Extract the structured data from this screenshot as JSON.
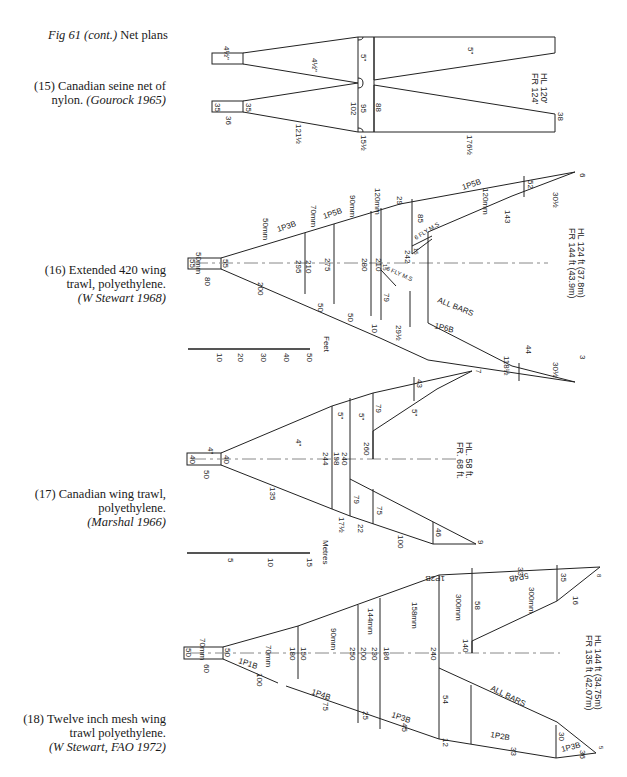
{
  "figure": {
    "title_italic": "Fig 61 (cont.)",
    "title_rest": " Net plans"
  },
  "captions": [
    {
      "number": "(15)",
      "line1": "Canadian seine net of",
      "line2": "nylon. ",
      "credit": "(Gourock 1965)"
    },
    {
      "number": "(16)",
      "line1": "Extended 420 wing",
      "line2": "trawl, polyethylene.",
      "credit": "(W Stewart 1968)"
    },
    {
      "number": "(17)",
      "line1": "Canadian wing trawl,",
      "line2": "polyethylene.",
      "credit": "(Marshal 1966)"
    },
    {
      "number": "(18)",
      "line1": "Twelve inch mesh wing",
      "line2": "trawl polyethylene.",
      "credit": "(W Stewart, FAO 1972)"
    }
  ],
  "diagram15": {
    "labels": {
      "cod_top": "4½\"",
      "wing_inner": "4½\"",
      "belly_mesh": "5\"",
      "wing_mesh": "5\"",
      "cod_a": "35",
      "cod_b": "35",
      "cod_c": "36",
      "taper": "121½",
      "w102": "102",
      "w95": "95",
      "w88": "88",
      "w15": "15½",
      "w176": "176½",
      "tip": "38"
    },
    "specs": {
      "hl": "HL 120'",
      "fr": "FR 124'"
    }
  },
  "diagram16": {
    "labels": {
      "cod_mesh": "50mm",
      "cod_a": "55",
      "cod_b": "55",
      "cod_c": "80",
      "m50": "50mm",
      "m70": "70mm",
      "m90": "90mm",
      "m120": "120mm",
      "tp1": "1P3B",
      "tp2": "1P5B",
      "tp3": "1P5B",
      "w295": "295",
      "w210a": "210",
      "w275": "275",
      "w280": "280",
      "w210b": "210",
      "w242": "242",
      "w200": "200",
      "w50a": "50",
      "w50b": "50",
      "w10": "10",
      "w29a": "29",
      "w29b": "29½",
      "w85": "85",
      "w79": "79",
      "w143": "143",
      "w52": "52",
      "w30a": "30½",
      "tip_top": "6",
      "w44": "44",
      "w118": "118½",
      "w30b": "30½",
      "tip_bot": "3",
      "all_bars": "ALL BARS",
      "tp_lower": "1P6B",
      "m120b": "120mm",
      "w15a": "15",
      "w15b": "15",
      "flymesh": "6 FLY M.S"
    },
    "specs": {
      "hl": "HL  124 ft  (37.8m)",
      "fr": "FR  144 ft  (43.9m)"
    },
    "scale": {
      "unit": "Feet",
      "ticks": [
        "10",
        "20",
        "30",
        "40",
        "50"
      ]
    }
  },
  "diagram17": {
    "labels": {
      "cod_mesh": "4\"",
      "cod_a": "40",
      "cod_b": "40",
      "cod_c": "50",
      "wing_mesh": "4\"",
      "m5a": "5\"",
      "m5b": "5\"",
      "m5c": "5\"",
      "w244": "244",
      "w198": "198",
      "w240": "240",
      "w260": "260",
      "w79a": "79",
      "w43": "43",
      "tip_top": "7",
      "w135": "135",
      "w17": "17½",
      "w79b": "79",
      "w22": "22",
      "w75": "75",
      "w100": "100",
      "w46": "46",
      "tip_bot": "9"
    },
    "specs": {
      "hl": "HL.   58 ft.",
      "fr": "FR.   68 ft."
    },
    "scale": {
      "unit": "Metres",
      "ticks": [
        "5",
        "10",
        "15"
      ]
    }
  },
  "diagram18": {
    "labels": {
      "cod_mesh": "70mm",
      "cod_a": "50",
      "cod_b": "50",
      "cod_c": "60",
      "m70": "70mm",
      "m90": "90mm",
      "m144": "144mm",
      "m158": "158mm",
      "m300a": "300mm",
      "m300b": "300mm",
      "w180": "180",
      "w150": "150",
      "w250": "250",
      "w200": "200",
      "w230": "230",
      "w186": "186",
      "w240": "240",
      "w140": "140",
      "w58": "58",
      "w35": "35",
      "w16": "16",
      "tip_top": "8",
      "w33": "33",
      "tp_top": "1P2B",
      "tp_top2": "5P4B",
      "tp1": "1P1B",
      "w100": "100",
      "tp4": "1P4B",
      "w75": "75",
      "w25": "25",
      "tp3": "1P3B",
      "w45": "45",
      "w54": "54",
      "all_bars": "ALL BARS",
      "w12": "12",
      "tp2": "1P2B",
      "w33b": "33",
      "w30": "30",
      "tp3b": "1P3B",
      "w36": "36",
      "tip_bot": "5"
    },
    "specs": {
      "hl": "HL  144 ft  (34.75m)",
      "fr": "FR  135 ft  (42.07m)"
    }
  }
}
